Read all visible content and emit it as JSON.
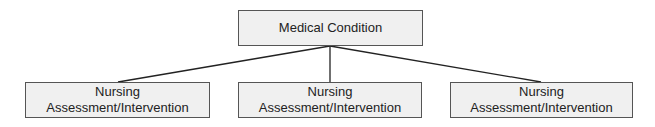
{
  "diagram": {
    "root": {
      "label": "Medical Condition"
    },
    "children": [
      {
        "line1": "Nursing",
        "line2": "Assessment/Intervention"
      },
      {
        "line1": "Nursing",
        "line2": "Assessment/Intervention"
      },
      {
        "line1": "Nursing",
        "line2": "Assessment/Intervention"
      }
    ],
    "colors": {
      "box_fill": "#f0f0f0",
      "box_border": "#555555",
      "line": "#222222"
    }
  }
}
